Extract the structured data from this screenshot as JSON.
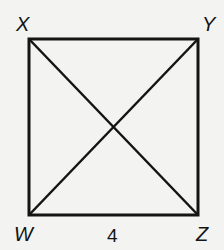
{
  "figure": {
    "type": "square with diagonals",
    "vertices": {
      "X": {
        "label": "X",
        "position": "top-left"
      },
      "Y": {
        "label": "Y",
        "position": "top-right"
      },
      "Z": {
        "label": "Z",
        "position": "bottom-right"
      },
      "W": {
        "label": "W",
        "position": "bottom-left"
      }
    },
    "segments": [
      "XY",
      "YZ",
      "ZW",
      "WX",
      "XZ",
      "YW"
    ],
    "measurements": [
      {
        "segment": "WZ",
        "value": "4"
      }
    ],
    "colors": {
      "stroke": "#141414",
      "background": "#f3f3f1"
    }
  }
}
